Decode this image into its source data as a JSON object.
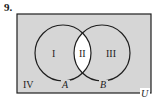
{
  "problem_number": "9.",
  "diagram": {
    "type": "venn",
    "universe_label": "U",
    "sets": [
      {
        "name": "A",
        "label": "A"
      },
      {
        "name": "B",
        "label": "B"
      }
    ],
    "regions": [
      {
        "id": "I",
        "label": "I",
        "description": "A only",
        "shaded": true
      },
      {
        "id": "II",
        "label": "II",
        "description": "A and B",
        "shaded": false
      },
      {
        "id": "III",
        "label": "III",
        "description": "B only",
        "shaded": true
      },
      {
        "id": "IV",
        "label": "IV",
        "description": "outside A and B",
        "shaded": true
      }
    ],
    "colors": {
      "shade": "#d6d6d6",
      "unshaded": "#ffffff",
      "stroke": "#1e1e1e"
    }
  }
}
